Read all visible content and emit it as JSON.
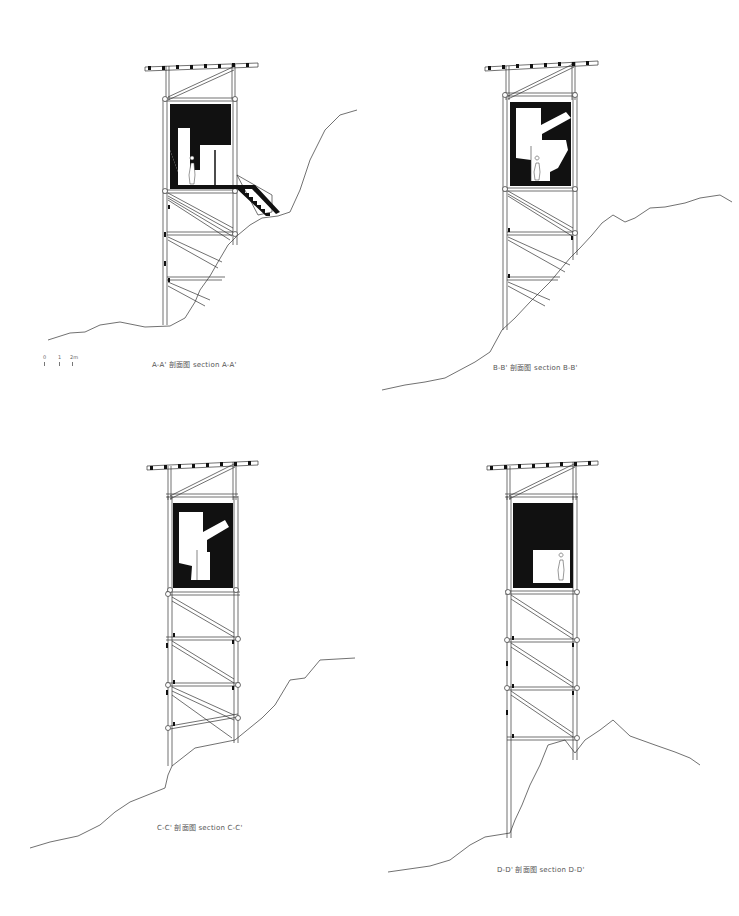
{
  "sheet": {
    "sections": [
      {
        "id": "A",
        "caption": "A-A' 剖面图  section A-A'"
      },
      {
        "id": "B",
        "caption": "B-B' 剖面图  section B-B'"
      },
      {
        "id": "C",
        "caption": "C-C' 剖面图  section C-C'"
      },
      {
        "id": "D",
        "caption": "D-D' 剖面图  section D-D'"
      }
    ],
    "scale_bar": {
      "labels": [
        "0",
        "1",
        "2m"
      ]
    }
  }
}
